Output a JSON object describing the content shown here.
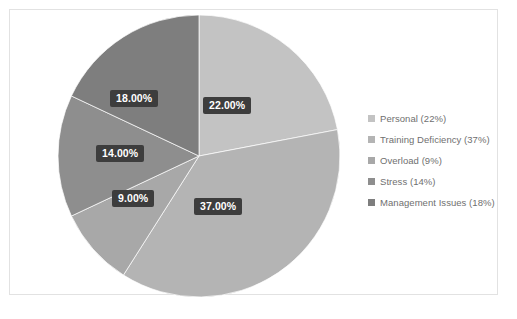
{
  "chart_data": {
    "type": "pie",
    "title": "",
    "subtitle": "",
    "xlabel": "",
    "ylabel": "",
    "grid": false,
    "legend_position": "right",
    "start_angle_deg": 0,
    "direction": "clockwise",
    "categories": [
      "Personal",
      "Training Deficiency",
      "Overload",
      "Stress",
      "Management Issues"
    ],
    "values": [
      22,
      37,
      9,
      14,
      18
    ],
    "value_unit": "%",
    "data_labels": [
      "22.00%",
      "37.00%",
      "9.00%",
      "14.00%",
      "18.00%"
    ],
    "legend_entries": [
      "Personal (22%)",
      "Training Deficiency (37%)",
      "Overload (9%)",
      "Stress (14%)",
      "Management Issues (18%)"
    ],
    "colors": [
      "#c3c3c3",
      "#b4b4b4",
      "#a8a8a8",
      "#8e8e8e",
      "#7e7e7e"
    ],
    "label_box_color": "#3d3d3d",
    "label_text_color": "#ffffff",
    "legend_text_color": "#6f6f6f",
    "border_color": "#e2e2e2",
    "background_color": "#ffffff"
  },
  "label_positions": [
    {
      "left": "203px",
      "top": "97px"
    },
    {
      "left": "194px",
      "top": "198px"
    },
    {
      "left": "112px",
      "top": "190px"
    },
    {
      "left": "96px",
      "top": "145px"
    },
    {
      "left": "110px",
      "top": "90px"
    }
  ]
}
